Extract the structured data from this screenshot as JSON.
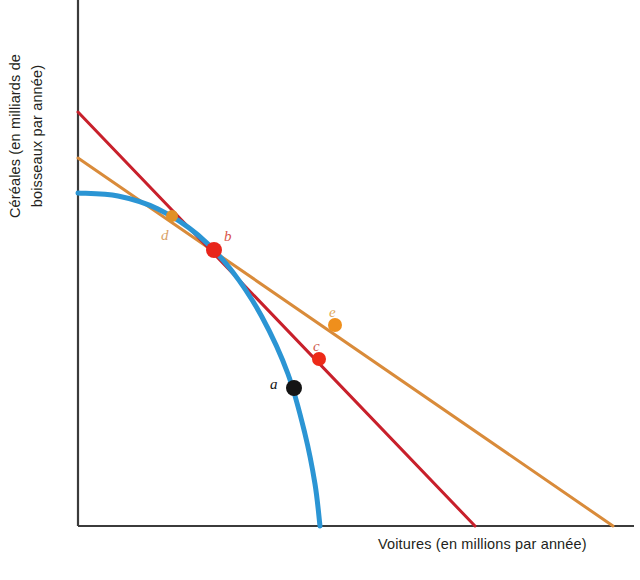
{
  "figure": {
    "type": "line",
    "background": "#ffffff"
  },
  "axes": {
    "xlabel": "Voitures (en millions par année)",
    "ylabel_line1": "Céréales (en milliards de",
    "ylabel_line2": "boisseaux par année)",
    "axis_color": "#3b3b3b",
    "origin_px": [
      78,
      526
    ],
    "x_axis_end_px": [
      634,
      526
    ],
    "y_axis_top_px": [
      78,
      0
    ],
    "ticks": [],
    "gridlines": false
  },
  "colors": {
    "ppf_curve": "#2b95d4",
    "red_line": "#c8202b",
    "orange_line": "#d98b3a",
    "point_a": "#141414",
    "point_b": "#e8251b",
    "point_c": "#ed2a18",
    "point_d": "#e09127",
    "point_e": "#ef8f1c",
    "label_a": "#141414",
    "label_b": "#d9544a",
    "label_c": "#cf5a4e",
    "label_d": "#d9a269",
    "label_e": "#e0a85a"
  },
  "chart_data": {
    "type": "line",
    "title": "",
    "xlabel": "Voitures (en millions par année)",
    "ylabel": "Céréales (en milliards de boisseaux par année)",
    "xlim": [
      0,
      100
    ],
    "ylim": [
      0,
      100
    ],
    "grid": false,
    "legend": "none",
    "series": [
      {
        "name": "ppf-curve",
        "kind": "curve",
        "color": "#2b95d4",
        "stroke_width": 5,
        "description": "Courbe des possibilités de production, concave vers l'origine",
        "points_px": [
          [
            78,
            193
          ],
          [
            118,
            196
          ],
          [
            158,
            209
          ],
          [
            198,
            235
          ],
          [
            232,
            271
          ],
          [
            262,
            317
          ],
          [
            288,
            374
          ],
          [
            305,
            434
          ],
          [
            315,
            484
          ],
          [
            320,
            526
          ]
        ]
      },
      {
        "name": "red-price-line",
        "kind": "line",
        "color": "#c8202b",
        "stroke_width": 3,
        "description": "Droite de prix tangente au point b, pente plus forte",
        "endpoints_px": [
          [
            78,
            112
          ],
          [
            475,
            526
          ]
        ]
      },
      {
        "name": "orange-price-line",
        "kind": "line",
        "color": "#d98b3a",
        "stroke_width": 3,
        "description": "Droite de prix tangente au point b, pente plus faible",
        "endpoints_px": [
          [
            78,
            158
          ],
          [
            613,
            526
          ]
        ]
      }
    ],
    "points": [
      {
        "name": "a",
        "label": "a",
        "color": "#141414",
        "label_color": "#141414",
        "radius": 8,
        "px": [
          294,
          388
        ],
        "label_px": [
          270,
          377
        ],
        "on": "ppf-curve",
        "note": "point à l'intérieur / sur la courbe"
      },
      {
        "name": "b",
        "label": "b",
        "color": "#e8251b",
        "label_color": "#d9544a",
        "radius": 8,
        "px": [
          214,
          250
        ],
        "label_px": [
          224,
          229
        ],
        "on": "tangency",
        "note": "point de tangence des deux droites de prix avec la courbe"
      },
      {
        "name": "c",
        "label": "c",
        "color": "#ed2a18",
        "label_color": "#cf5a4e",
        "radius": 7,
        "px": [
          319,
          359
        ],
        "label_px": [
          313,
          339
        ],
        "on": "red-price-line"
      },
      {
        "name": "d",
        "label": "d",
        "color": "#e09127",
        "label_color": "#d9a269",
        "radius": 6,
        "px": [
          172,
          216
        ],
        "label_px": [
          161,
          228
        ],
        "on": "orange-price-line"
      },
      {
        "name": "e",
        "label": "e",
        "color": "#ef8f1c",
        "label_color": "#e0a85a",
        "radius": 7,
        "px": [
          335,
          325
        ],
        "label_px": [
          329,
          305
        ],
        "on": "orange-price-line"
      }
    ]
  }
}
